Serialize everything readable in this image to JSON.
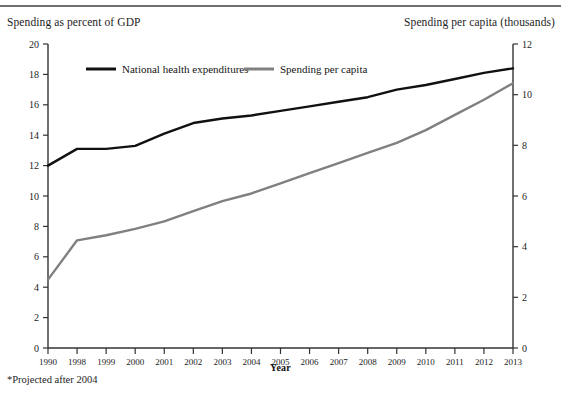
{
  "figure": {
    "header_left": "Spending as percent of GDP",
    "header_right": "Spending per capita (thousands)",
    "xaxis_title": "Year",
    "footnote": "*Projected after 2004"
  },
  "colors": {
    "series_black": "#111111",
    "series_gray": "#808080",
    "axis": "#333333",
    "rule": "#6f6f6f",
    "text": "#1c1c1c"
  },
  "chart_data": {
    "type": "line",
    "title": "",
    "xlabel": "Year",
    "ylabel": "Spending as percent of GDP",
    "y2label": "Spending per capita (thousands)",
    "categories": [
      "1990",
      "1998",
      "1999",
      "2000",
      "2001",
      "2002",
      "2003",
      "2004",
      "2005",
      "2006",
      "2007",
      "2008",
      "2009",
      "2010",
      "2011",
      "2012",
      "2013"
    ],
    "ylim": [
      0,
      20
    ],
    "yticks": [
      0,
      2,
      4,
      6,
      8,
      10,
      12,
      14,
      16,
      18,
      20
    ],
    "y2lim": [
      0,
      12
    ],
    "y2ticks": [
      0,
      2,
      4,
      6,
      8,
      10,
      12
    ],
    "grid": false,
    "legend_position": "top-inside",
    "series": [
      {
        "name": "National health expenditures",
        "color": "#111111",
        "axis": "left",
        "values": [
          12.0,
          13.1,
          13.1,
          13.3,
          14.1,
          14.8,
          15.1,
          15.3,
          15.6,
          15.9,
          16.2,
          16.5,
          17.0,
          17.3,
          17.7,
          18.1,
          18.4
        ]
      },
      {
        "name": "Spending per capita",
        "color": "#808080",
        "axis": "right",
        "values": [
          2.7,
          4.25,
          4.45,
          4.7,
          5.0,
          5.4,
          5.8,
          6.1,
          6.5,
          6.9,
          7.3,
          7.7,
          8.1,
          8.6,
          9.2,
          9.8,
          10.45
        ]
      }
    ]
  },
  "legend": [
    {
      "label": "National health expenditures",
      "color": "#111111"
    },
    {
      "label": "Spending per capita",
      "color": "#808080"
    }
  ]
}
